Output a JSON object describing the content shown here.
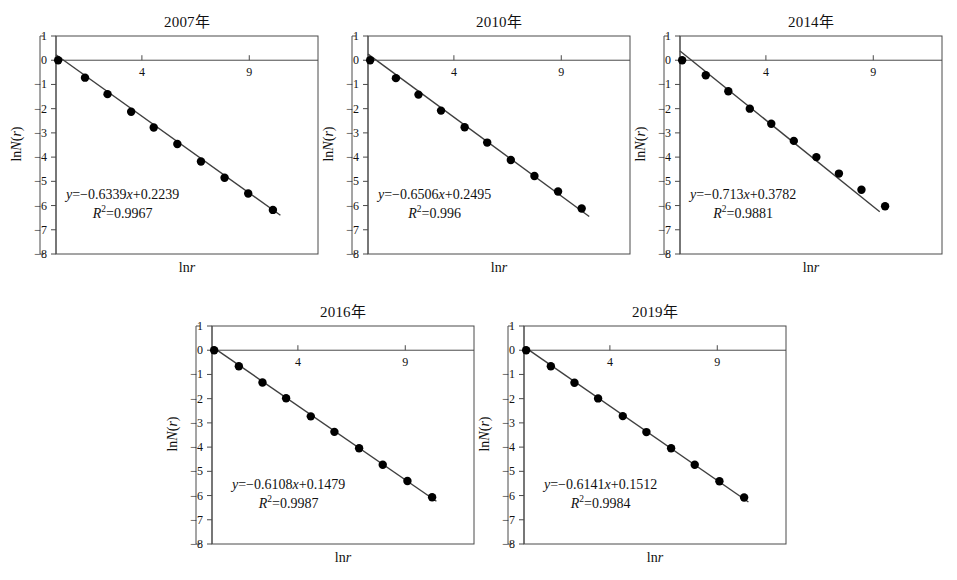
{
  "figure": {
    "axis": {
      "ylabel": "lnN(r)",
      "xlabel": "lnr",
      "yticks": [
        "1",
        "0",
        "-1",
        "-2",
        "-3",
        "-4",
        "-5",
        "-6",
        "-7",
        "-8"
      ],
      "ytick_values": [
        1,
        0,
        -1,
        -2,
        -3,
        -4,
        -5,
        -6,
        -7,
        -8
      ],
      "xticks": [
        "4",
        "9"
      ],
      "xtick_values": [
        4,
        9
      ],
      "ylim": [
        -8,
        1
      ],
      "xlim": [
        0,
        12.2
      ]
    },
    "colors": {
      "axis": "#4a4a4a",
      "marker": "#000000",
      "fit_line": "#3f3f3f",
      "text": "#111111",
      "background": "#ffffff"
    }
  },
  "chart_data": [
    {
      "type": "scatter",
      "title": "2007年",
      "xlabel": "lnr",
      "ylabel": "lnN(r)",
      "xlim": [
        0,
        12.2
      ],
      "ylim": [
        -8,
        1
      ],
      "xticks": [
        4,
        9
      ],
      "yticks": [
        1,
        0,
        -1,
        -2,
        -3,
        -4,
        -5,
        -6,
        -7,
        -8
      ],
      "grid": false,
      "legend": null,
      "x": [
        0.1,
        1.35,
        2.4,
        3.5,
        4.55,
        5.65,
        6.7,
        7.8,
        8.85,
        9.9,
        10.95
      ],
      "y": [
        0.0,
        -0.72,
        -1.4,
        -2.13,
        -2.78,
        -3.46,
        -4.18,
        -4.85,
        -5.5,
        -6.18,
        -6.18
      ],
      "points": [
        {
          "x": 0.1,
          "y": 0.0
        },
        {
          "x": 1.35,
          "y": -0.72
        },
        {
          "x": 2.4,
          "y": -1.4
        },
        {
          "x": 3.5,
          "y": -2.13
        },
        {
          "x": 4.55,
          "y": -2.78
        },
        {
          "x": 5.65,
          "y": -3.46
        },
        {
          "x": 6.75,
          "y": -4.18
        },
        {
          "x": 7.85,
          "y": -4.85
        },
        {
          "x": 8.95,
          "y": -5.5
        },
        {
          "x": 10.1,
          "y": -6.18
        }
      ],
      "fit": {
        "slope": -0.6339,
        "intercept": 0.2239,
        "r_squared": 0.9967,
        "equation": "y=-0.6339x+0.2239",
        "r2_label": "R2=0.9967",
        "x_start": 0.0,
        "x_end": 10.45
      }
    },
    {
      "type": "scatter",
      "title": "2010年",
      "xlabel": "lnr",
      "ylabel": "lnN(r)",
      "xlim": [
        0,
        12.2
      ],
      "ylim": [
        -8,
        1
      ],
      "xticks": [
        4,
        9
      ],
      "yticks": [
        1,
        0,
        -1,
        -2,
        -3,
        -4,
        -5,
        -6,
        -7,
        -8
      ],
      "grid": false,
      "legend": null,
      "x": [
        0.1,
        1.3,
        2.35,
        3.4,
        4.5,
        5.55,
        6.6,
        7.7,
        8.75,
        9.8
      ],
      "y": [
        0.0,
        -0.74,
        -1.42,
        -2.08,
        -2.77,
        -3.4,
        -4.12,
        -4.78,
        -5.42,
        -6.12
      ],
      "points": [
        {
          "x": 0.1,
          "y": 0.0
        },
        {
          "x": 1.3,
          "y": -0.74
        },
        {
          "x": 2.35,
          "y": -1.42
        },
        {
          "x": 3.4,
          "y": -2.08
        },
        {
          "x": 4.5,
          "y": -2.77
        },
        {
          "x": 5.55,
          "y": -3.4
        },
        {
          "x": 6.65,
          "y": -4.12
        },
        {
          "x": 7.75,
          "y": -4.78
        },
        {
          "x": 8.85,
          "y": -5.42
        },
        {
          "x": 9.95,
          "y": -6.12
        }
      ],
      "fit": {
        "slope": -0.6506,
        "intercept": 0.2495,
        "r_squared": 0.996,
        "equation": "y=-0.6506x+0.2495",
        "r2_label": "R2=0.996",
        "x_start": 0.0,
        "x_end": 10.3
      }
    },
    {
      "type": "scatter",
      "title": "2014年",
      "xlabel": "lnr",
      "ylabel": "lnN(r)",
      "xlim": [
        0,
        12.2
      ],
      "ylim": [
        -8,
        1
      ],
      "xticks": [
        4,
        9
      ],
      "yticks": [
        1,
        0,
        -1,
        -2,
        -3,
        -4,
        -5,
        -6,
        -7,
        -8
      ],
      "grid": false,
      "legend": null,
      "x": [
        0.1,
        1.2,
        2.2,
        3.2,
        4.2,
        5.2,
        6.25,
        7.25,
        8.3,
        9.3
      ],
      "y": [
        0.0,
        -0.62,
        -1.28,
        -2.0,
        -2.62,
        -3.33,
        -4.0,
        -4.68,
        -5.35,
        -6.03
      ],
      "points": [
        {
          "x": 0.1,
          "y": 0.0
        },
        {
          "x": 1.2,
          "y": -0.62
        },
        {
          "x": 2.25,
          "y": -1.28
        },
        {
          "x": 3.25,
          "y": -2.0
        },
        {
          "x": 4.25,
          "y": -2.62
        },
        {
          "x": 5.3,
          "y": -3.33
        },
        {
          "x": 6.35,
          "y": -4.0
        },
        {
          "x": 7.4,
          "y": -4.68
        },
        {
          "x": 8.45,
          "y": -5.35
        },
        {
          "x": 9.55,
          "y": -6.03
        }
      ],
      "fit": {
        "slope": -0.713,
        "intercept": 0.3782,
        "r_squared": 0.9881,
        "equation": "y=-0.713x+0.3782",
        "r2_label": "R2=0.9881",
        "x_start": 0.0,
        "x_end": 9.3
      }
    },
    {
      "type": "scatter",
      "title": "2016年",
      "xlabel": "lnr",
      "ylabel": "lnN(r)",
      "xlim": [
        0,
        12.2
      ],
      "ylim": [
        -8,
        1
      ],
      "xticks": [
        4,
        9
      ],
      "yticks": [
        1,
        0,
        -1,
        -2,
        -3,
        -4,
        -5,
        -6,
        -7,
        -8
      ],
      "grid": false,
      "legend": null,
      "x": [
        0.1,
        1.25,
        2.35,
        3.45,
        4.55,
        5.65,
        6.75,
        7.85,
        8.95,
        10.05
      ],
      "y": [
        0.0,
        -0.66,
        -1.33,
        -1.98,
        -2.73,
        -3.37,
        -4.05,
        -4.73,
        -5.4,
        -6.07
      ],
      "points": [
        {
          "x": 0.1,
          "y": 0.0
        },
        {
          "x": 1.25,
          "y": -0.66
        },
        {
          "x": 2.35,
          "y": -1.33
        },
        {
          "x": 3.45,
          "y": -1.98
        },
        {
          "x": 4.6,
          "y": -2.73
        },
        {
          "x": 5.7,
          "y": -3.37
        },
        {
          "x": 6.85,
          "y": -4.05
        },
        {
          "x": 7.95,
          "y": -4.73
        },
        {
          "x": 9.1,
          "y": -5.4
        },
        {
          "x": 10.25,
          "y": -6.07
        }
      ],
      "fit": {
        "slope": -0.6108,
        "intercept": 0.1479,
        "r_squared": 0.9987,
        "equation": "y=-0.6108x+0.1479",
        "r2_label": "R2=0.9987",
        "x_start": 0.0,
        "x_end": 10.45
      }
    },
    {
      "type": "scatter",
      "title": "2019年",
      "xlabel": "lnr",
      "ylabel": "lnN(r)",
      "xlim": [
        0,
        12.2
      ],
      "ylim": [
        -8,
        1
      ],
      "xticks": [
        4,
        9
      ],
      "yticks": [
        1,
        0,
        -1,
        -2,
        -3,
        -4,
        -5,
        -6,
        -7,
        -8
      ],
      "grid": false,
      "legend": null,
      "x": [
        0.1,
        1.25,
        2.35,
        3.45,
        4.55,
        5.65,
        6.8,
        7.9,
        9.0,
        10.15
      ],
      "y": [
        0.0,
        -0.66,
        -1.34,
        -1.99,
        -2.72,
        -3.38,
        -4.05,
        -4.73,
        -5.41,
        -6.08
      ],
      "points": [
        {
          "x": 0.1,
          "y": 0.0
        },
        {
          "x": 1.25,
          "y": -0.66
        },
        {
          "x": 2.35,
          "y": -1.34
        },
        {
          "x": 3.45,
          "y": -1.99
        },
        {
          "x": 4.6,
          "y": -2.72
        },
        {
          "x": 5.7,
          "y": -3.38
        },
        {
          "x": 6.85,
          "y": -4.05
        },
        {
          "x": 7.95,
          "y": -4.73
        },
        {
          "x": 9.1,
          "y": -5.41
        },
        {
          "x": 10.25,
          "y": -6.08
        }
      ],
      "fit": {
        "slope": -0.6141,
        "intercept": 0.1512,
        "r_squared": 0.9984,
        "equation": "y=-0.6141x+0.1512",
        "r2_label": "R2=0.9984",
        "x_start": 0.0,
        "x_end": 10.45
      }
    }
  ],
  "panel_layout": [
    {
      "left": 56,
      "top": 10,
      "plot_w": 262,
      "plot_h": 218,
      "eq_left": 10,
      "eq_top": 150
    },
    {
      "left": 368,
      "top": 10,
      "plot_w": 262,
      "plot_h": 218,
      "eq_left": 10,
      "eq_top": 150
    },
    {
      "left": 680,
      "top": 10,
      "plot_w": 262,
      "plot_h": 218,
      "eq_left": 10,
      "eq_top": 150
    },
    {
      "left": 212,
      "top": 300,
      "plot_w": 262,
      "plot_h": 218,
      "eq_left": 20,
      "eq_top": 150
    },
    {
      "left": 524,
      "top": 300,
      "plot_w": 262,
      "plot_h": 218,
      "eq_left": 20,
      "eq_top": 150
    }
  ]
}
